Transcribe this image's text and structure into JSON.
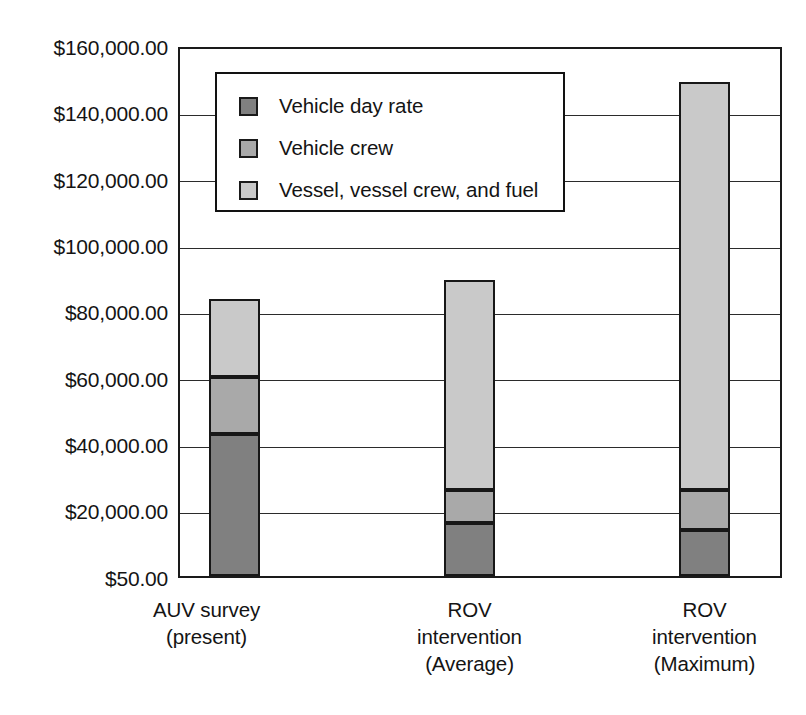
{
  "chart_data": {
    "type": "bar",
    "subtype": "stacked-vertical",
    "title": "",
    "xlabel": "",
    "ylabel": "",
    "categories": [
      "AUV survey\n(present)",
      "ROV intervention\n(Average)",
      "ROV intervention\n(Maximum)"
    ],
    "category_lines": [
      [
        "AUV survey",
        "(present)"
      ],
      [
        "ROV",
        "intervention",
        "(Average)"
      ],
      [
        "ROV",
        "intervention",
        "(Maximum)"
      ]
    ],
    "series": [
      {
        "name": "Vehicle day rate",
        "color": "#808080",
        "values": [
          43000,
          16000,
          14000
        ]
      },
      {
        "name": "Vehicle crew",
        "color": "#a9a9a9",
        "values": [
          17500,
          10000,
          12000
        ]
      },
      {
        "name": "Vessel, vessel crew, and fuel",
        "color": "#c9c9c9",
        "values": [
          23500,
          64000,
          124000
        ]
      }
    ],
    "totals": [
      84000,
      90000,
      150000
    ],
    "ylim": [
      0,
      160000
    ],
    "ytick_values": [
      160000,
      140000,
      120000,
      100000,
      80000,
      60000,
      40000,
      20000,
      0
    ],
    "ytick_labels": [
      "$160,000.00",
      "$140,000.00",
      "$120,000.00",
      "$100,000.00",
      "$80,000.00",
      "$60,000.00",
      "$40,000.00",
      "$20,000.00",
      "$50.00"
    ],
    "grid": true,
    "grid_axis": "y",
    "legend_position": "inside-upper-left",
    "legend_entries": [
      {
        "label": "Vehicle day rate",
        "swatch": "#808080"
      },
      {
        "label": "Vehicle crew",
        "swatch": "#a9a9a9"
      },
      {
        "label": "Vessel, vessel crew, and fuel",
        "swatch": "#c9c9c9"
      }
    ]
  },
  "axis": {
    "ticks": [
      {
        "label": "$160,000.00",
        "value": 160000
      },
      {
        "label": "$140,000.00",
        "value": 140000
      },
      {
        "label": "$120,000.00",
        "value": 120000
      },
      {
        "label": "$100,000.00",
        "value": 100000
      },
      {
        "label": "$80,000.00",
        "value": 80000
      },
      {
        "label": "$60,000.00",
        "value": 60000
      },
      {
        "label": "$40,000.00",
        "value": 40000
      },
      {
        "label": "$20,000.00",
        "value": 20000
      },
      {
        "label": "$50.00",
        "value": 0
      }
    ]
  },
  "legend": {
    "items": [
      {
        "label": "Vehicle day rate"
      },
      {
        "label": "Vehicle crew"
      },
      {
        "label": "Vessel, vessel crew, and fuel"
      }
    ]
  },
  "categories": [
    {
      "line1": "AUV survey",
      "line2": "(present)",
      "line3": ""
    },
    {
      "line1": "ROV",
      "line2": "intervention",
      "line3": "(Average)"
    },
    {
      "line1": "ROV",
      "line2": "intervention",
      "line3": "(Maximum)"
    }
  ],
  "colors": {
    "vehicle_day_rate": "#808080",
    "vehicle_crew": "#a9a9a9",
    "vessel_crew_fuel": "#c9c9c9",
    "axis": "#1a1a1a",
    "grid": "#2b2b2b",
    "background": "#ffffff"
  }
}
